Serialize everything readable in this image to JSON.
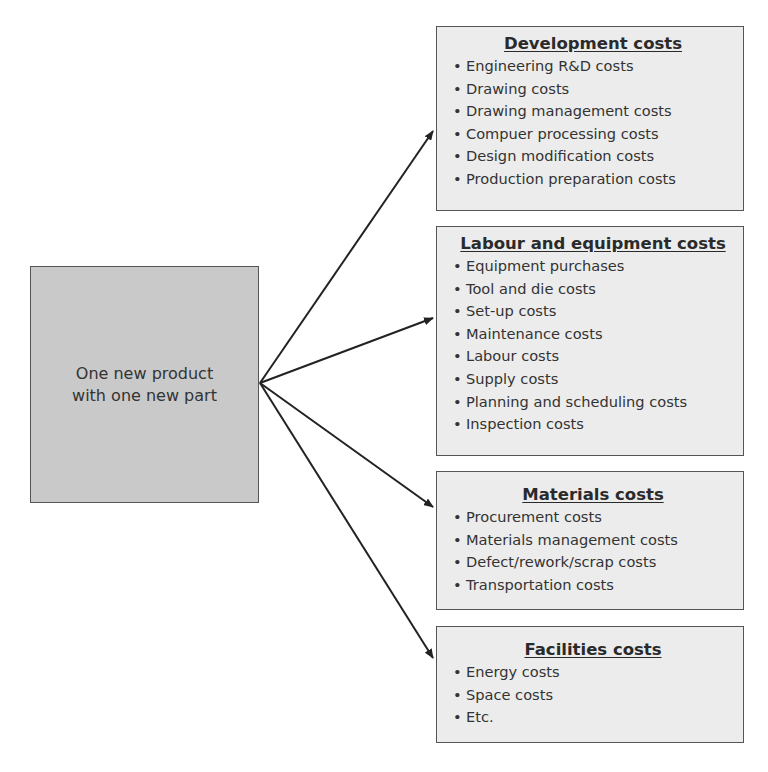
{
  "source": {
    "label": "One new product\nwith one new part"
  },
  "categories": [
    {
      "title": "Development costs",
      "items": [
        "Engineering R&D costs",
        "Drawing costs",
        "Drawing management costs",
        "Compuer processing costs",
        "Design modification costs",
        "Production preparation costs"
      ]
    },
    {
      "title": "Labour and equipment costs",
      "items": [
        "Equipment purchases",
        "Tool and die costs",
        "Set-up costs",
        "Maintenance costs",
        "Labour costs",
        "Supply costs",
        "Planning and scheduling costs",
        "Inspection costs"
      ]
    },
    {
      "title": "Materials costs",
      "items": [
        "Procurement costs",
        "Materials management costs",
        "Defect/rework/scrap costs",
        "Transportation costs"
      ]
    },
    {
      "title": "Facilities costs",
      "items": [
        "Energy costs",
        "Space costs",
        "Etc."
      ]
    }
  ],
  "bullet": "•",
  "colors": {
    "source_bg": "#c9c9c9",
    "box_bg": "#ececec",
    "border": "#555555",
    "arrow": "#222222"
  }
}
